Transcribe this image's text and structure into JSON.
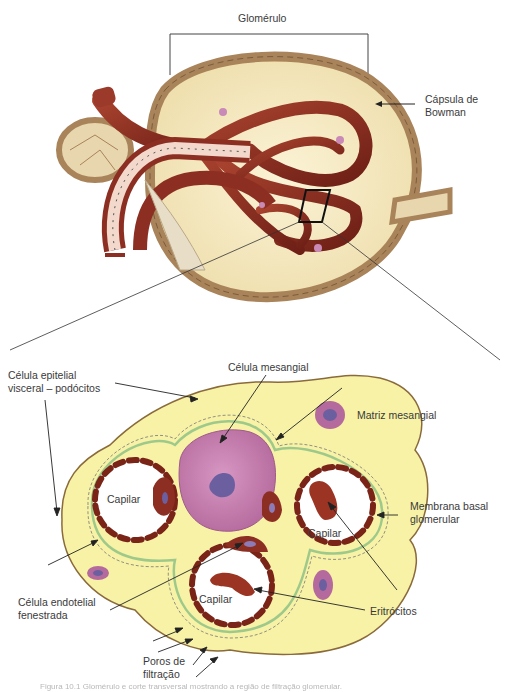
{
  "figure": {
    "top_view": {
      "title": "Glomérulo",
      "callouts": [
        {
          "id": "bowman",
          "text_lines": [
            "Cápsula de",
            "Bowman"
          ]
        }
      ]
    },
    "cross_section": {
      "callouts": [
        {
          "id": "podocitos",
          "text_lines": [
            "Célula epitelial",
            "visceral – podócitos"
          ]
        },
        {
          "id": "mesangial_cell",
          "text_lines": [
            "Célula mesangial"
          ]
        },
        {
          "id": "mesangial_matrix",
          "text_lines": [
            "Matriz mesangial"
          ]
        },
        {
          "id": "basal_membrane",
          "text_lines": [
            "Membrana basal",
            "glomerular"
          ]
        },
        {
          "id": "endothelial",
          "text_lines": [
            "Célula endotelial",
            "fenestrada"
          ]
        },
        {
          "id": "erythrocytes",
          "text_lines": [
            "Eritrócitos"
          ]
        },
        {
          "id": "pores",
          "text_lines": [
            "Poros de",
            "filtração"
          ]
        }
      ],
      "capillary_labels": [
        "Capilar",
        "Capilar",
        "Capilar"
      ]
    },
    "caption": "Figura 10.1 Glomérulo e corte transversal mostrando a região de filtração glomerular."
  },
  "colors": {
    "capsule_outer": "#a9835a",
    "capsule_inner": "#f3e6bf",
    "vessel": "#8c2f22",
    "tubule_light": "#f2d9cc",
    "epithelium_yellow": "#f7f2a6",
    "basal_membrane": "#9fc98a",
    "mesangial_cell": "#c07aa8",
    "nucleus": "#6c5fa0",
    "endothelium": "#7a2418",
    "line": "#222222"
  }
}
